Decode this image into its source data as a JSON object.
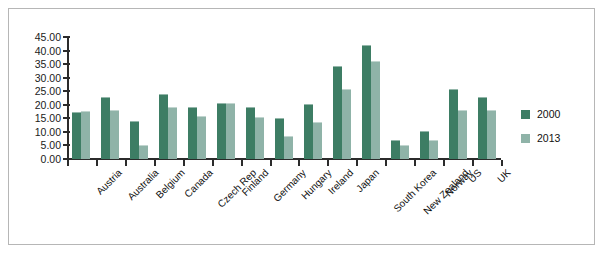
{
  "chart_data": {
    "type": "bar",
    "title": "",
    "xlabel": "",
    "ylabel": "",
    "ylim": [
      0,
      45
    ],
    "ytick_step": 5,
    "grid": false,
    "legend_position": "right",
    "categories": [
      "Austria",
      "Australia",
      "Belgium",
      "Canada",
      "Czech Rep",
      "Finland",
      "Germany",
      "Hungary",
      "Ireland",
      "Japan",
      "South Korea",
      "New Zealand",
      "Norway",
      "US",
      "UK"
    ],
    "ytick_labels": [
      "45.00",
      "40.00",
      "35.00",
      "30.00",
      "25.00",
      "20.00",
      "15.00",
      "10.00",
      "5.00",
      "0.00"
    ],
    "ytick_values": [
      45,
      40,
      35,
      30,
      25,
      20,
      15,
      10,
      5,
      0
    ],
    "series": [
      {
        "name": "2000",
        "color": "#3d7d64",
        "values": [
          17.2,
          23.0,
          14.0,
          23.8,
          19.2,
          20.8,
          19.2,
          15.0,
          20.3,
          34.2,
          42.0,
          7.0,
          10.2,
          26.0,
          23.0
        ]
      },
      {
        "name": "2013",
        "color": "#8fb3a8",
        "values": [
          17.8,
          18.0,
          5.0,
          19.2,
          16.0,
          20.8,
          15.4,
          8.5,
          13.6,
          26.0,
          36.0,
          5.2,
          7.0,
          18.0,
          18.0
        ]
      }
    ],
    "legend": [
      {
        "label": "2000",
        "color": "#3d7d64"
      },
      {
        "label": "2013",
        "color": "#8fb3a8"
      }
    ]
  },
  "frame": {
    "border_color": "#b6b6b6",
    "background": "#ffffff",
    "axis_color": "#2b2b2b"
  }
}
